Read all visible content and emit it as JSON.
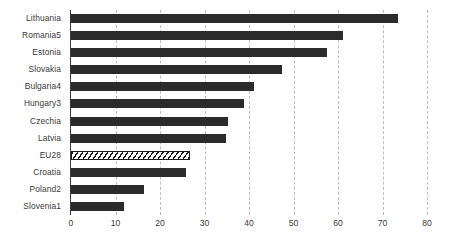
{
  "chart_data": {
    "type": "bar",
    "orientation": "horizontal",
    "title": "",
    "xlabel": "",
    "ylabel": "",
    "xlim": [
      0,
      80
    ],
    "xticks": [
      0,
      10,
      20,
      30,
      40,
      50,
      60,
      70,
      80
    ],
    "grid": "vertical-dashed",
    "legend": "none",
    "categories": [
      "Lithuania",
      "Romania5",
      "Estonia",
      "Slovakia",
      "Bulgaria4",
      "Hungary3",
      "Czechia",
      "Latvia",
      "EU28",
      "Croatia",
      "Poland2",
      "Slovenia1"
    ],
    "values": [
      73.5,
      61.2,
      57.5,
      47.4,
      41.1,
      38.9,
      35.3,
      34.8,
      26.3,
      25.8,
      16.4,
      11.9
    ],
    "bar_styles": [
      "solid",
      "solid",
      "solid",
      "solid",
      "solid",
      "solid",
      "solid",
      "solid",
      "hatched",
      "solid",
      "solid",
      "solid"
    ],
    "colors": {
      "bar_solid": "#2b2b2b",
      "bar_hatched_fill": "#ffffff",
      "bar_hatched_line": "#1a1a1a",
      "gridline": "#bdbdbd",
      "axis": "#3f3f3f",
      "text": "#3a3a3a",
      "background": "#ffffff"
    }
  }
}
